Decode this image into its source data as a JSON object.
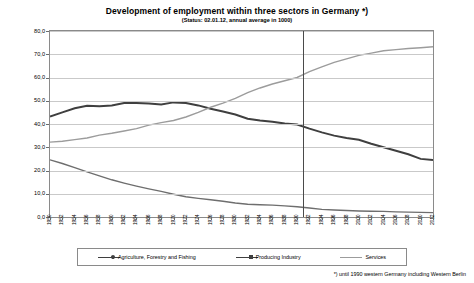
{
  "chart_data": {
    "type": "line",
    "title": "Development of employment within three sectors in Germany *)",
    "subtitle": "(Status: 02.01.12, annual average in 1000)",
    "xlabel": "",
    "ylabel": "",
    "ylim": [
      0,
      80
    ],
    "yticks": [
      "0,0",
      "10,0",
      "20,0",
      "30,0",
      "40,0",
      "50,0",
      "60,0",
      "70,0",
      "80,0"
    ],
    "grid": true,
    "legend_position": "bottom",
    "annotation_vline_year": "1991",
    "categories": [
      "1950",
      "1952",
      "1954",
      "1956",
      "1958",
      "1960",
      "1962",
      "1964",
      "1966",
      "1968",
      "1970",
      "1972",
      "1974",
      "1976",
      "1978",
      "1980",
      "1982",
      "1984",
      "1986",
      "1988",
      "1990",
      "1992",
      "1994",
      "1996",
      "1998",
      "2000",
      "2002",
      "2004",
      "2006",
      "2008",
      "2010",
      "2012"
    ],
    "series": [
      {
        "name": "Agriculture, Forestry and Fishing",
        "color": "#6e6e6e",
        "values": [
          24.6,
          23.0,
          21.2,
          19.4,
          17.7,
          16.0,
          14.6,
          13.3,
          12.1,
          11.0,
          9.8,
          8.7,
          8.0,
          7.4,
          6.8,
          6.0,
          5.5,
          5.3,
          5.1,
          4.8,
          4.4,
          3.9,
          3.3,
          3.0,
          2.8,
          2.6,
          2.5,
          2.4,
          2.2,
          2.1,
          2.0,
          1.9
        ]
      },
      {
        "name": "Producing Industry",
        "color": "#3f3f3f",
        "values": [
          43.2,
          45.0,
          46.8,
          47.8,
          47.6,
          48.0,
          49.0,
          49.0,
          48.8,
          48.4,
          49.3,
          49.0,
          48.0,
          46.6,
          45.4,
          44.1,
          42.3,
          41.5,
          41.0,
          40.2,
          39.8,
          38.0,
          36.4,
          35.0,
          34.0,
          33.2,
          31.5,
          30.0,
          28.5,
          27.0,
          25.0,
          24.5
        ]
      },
      {
        "name": "Services",
        "color": "#9c9c9c",
        "values": [
          32.2,
          32.6,
          33.3,
          34.0,
          35.2,
          36.0,
          37.0,
          38.0,
          39.5,
          40.6,
          41.5,
          43.0,
          45.0,
          47.2,
          49.0,
          51.0,
          53.5,
          55.5,
          57.2,
          58.6,
          60.0,
          62.5,
          64.6,
          66.5,
          68.0,
          69.5,
          70.5,
          71.5,
          72.0,
          72.5,
          72.8,
          73.2
        ]
      }
    ],
    "legend": [
      {
        "label": "Agriculture, Forestry and Fishing",
        "color": "#3f3f3f",
        "marker": "diamond"
      },
      {
        "label": "Producing Industry",
        "color": "#3f3f3f",
        "marker": "square"
      },
      {
        "label": "Services",
        "color": "#9c9c9c",
        "marker": "none"
      }
    ],
    "footnote": "*) until 1990 western Germany including Western Berlin"
  }
}
